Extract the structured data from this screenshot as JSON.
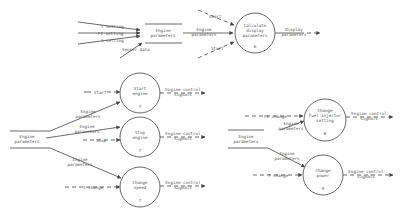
{
  "diagram": {
    "type": "data-flow-diagram",
    "processes": [
      {
        "id": "p6",
        "label_lines": [
          "Calculate",
          "display",
          "parameters"
        ],
        "number": "6"
      },
      {
        "id": "p7a",
        "label_lines": [
          "Start",
          "engine"
        ],
        "number": "7"
      },
      {
        "id": "p7b",
        "label_lines": [
          "Stop",
          "engine"
        ],
        "number": "7"
      },
      {
        "id": "p7c",
        "label_lines": [
          "Change",
          "speed"
        ],
        "number": "7"
      },
      {
        "id": "p8",
        "label_lines": [
          "Change",
          "fuel injector",
          "setting"
        ],
        "number": "8"
      },
      {
        "id": "p9",
        "label_lines": [
          "Change",
          "power"
        ],
        "number": "9"
      }
    ],
    "stores": {
      "top": {
        "label_lines": [
          "Engine",
          "parameters"
        ]
      },
      "left": {
        "label_lines": [
          "Engine",
          "parameters"
        ]
      },
      "right": {
        "label_lines": [
          "Engine",
          "parameters"
        ]
      }
    },
    "flows": {
      "t_setting": "T setting",
      "fi_setting": "FI setting",
      "s_setting": "S setting",
      "sensor_data": "Sensor data",
      "engine_parameters_lines": [
        "Engine",
        "parameters"
      ],
      "start": "Start",
      "start_t": "Start",
      "stop": "Stop",
      "display_parameters_lines": [
        "Display",
        "parameters"
      ],
      "engine_control_signals_lines": [
        "Engine control",
        "signals"
      ],
      "s_change": "S change",
      "fi_change": "FI change",
      "t_change": "T change"
    },
    "colors": {
      "line": "#444444",
      "text": "#555555",
      "background": "#ffffff"
    }
  }
}
